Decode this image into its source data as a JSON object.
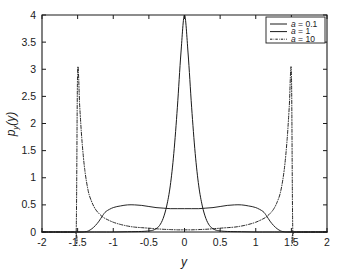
{
  "figure": {
    "name": "probability-density-plot",
    "background_color": "#ffffff",
    "line_color": "#1a1a1a"
  },
  "axes": {
    "xlabel": "y",
    "ylabel_main": "p",
    "ylabel_sub": "y",
    "ylabel_arg": "(y)",
    "ylabel_full": "p_y (y)",
    "x_ticks": [
      "-2",
      "-1.5",
      "-1",
      "-0.5",
      "0",
      "0.5",
      "1",
      "1.5",
      "2"
    ],
    "y_ticks": [
      "0",
      "0.5",
      "1",
      "1.5",
      "2",
      "2.5",
      "3",
      "3.5",
      "4"
    ],
    "xlim": [
      -2,
      2
    ],
    "ylim": [
      0,
      4
    ]
  },
  "legend": {
    "position": "top-right",
    "entries": [
      {
        "label_prefix": "a",
        "label_suffix": " = 0.1",
        "style": "solid"
      },
      {
        "label_prefix": "a",
        "label_suffix": " = 1",
        "style": "solid-thin"
      },
      {
        "label_prefix": "a",
        "label_suffix": " = 10",
        "style": "dashdot"
      }
    ]
  },
  "chart_data": {
    "type": "line",
    "title": "",
    "xlabel": "y",
    "ylabel": "p_y (y)",
    "xlim": [
      -2,
      2
    ],
    "ylim": [
      0,
      4
    ],
    "grid": false,
    "legend_position": "upper right",
    "x_ticks": [
      -2,
      -1.5,
      -1,
      -0.5,
      0,
      0.5,
      1,
      1.5,
      2
    ],
    "y_ticks": [
      0,
      0.5,
      1,
      1.5,
      2,
      2.5,
      3,
      3.5,
      4
    ],
    "series": [
      {
        "name": "a = 0.1",
        "style": "solid",
        "description": "Sharp unimodal peak centered at y = 0 reaching 4.0, decaying to near zero by |y| = 0.45",
        "x": [
          -2,
          -1.5,
          -1.2,
          -1.0,
          -0.8,
          -0.6,
          -0.5,
          -0.45,
          -0.4,
          -0.35,
          -0.3,
          -0.25,
          -0.2,
          -0.15,
          -0.1,
          -0.05,
          0,
          0.05,
          0.1,
          0.15,
          0.2,
          0.25,
          0.3,
          0.35,
          0.4,
          0.45,
          0.5,
          0.6,
          0.8,
          1.0,
          1.2,
          1.5,
          2
        ],
        "y": [
          0.0,
          0.0,
          0.0,
          0.0,
          0.005,
          0.01,
          0.02,
          0.03,
          0.06,
          0.12,
          0.25,
          0.48,
          0.85,
          1.45,
          2.3,
          3.3,
          4.0,
          3.3,
          2.3,
          1.45,
          0.85,
          0.48,
          0.25,
          0.12,
          0.06,
          0.03,
          0.02,
          0.01,
          0.005,
          0.0,
          0.0,
          0.0,
          0.0
        ]
      },
      {
        "name": "a = 1",
        "style": "solid-thin",
        "description": "Broad flat plateau spanning roughly -1.1 to 1.1 at about 0.45-0.50, slight dip to 0.43 at center, falling to zero near |y| = 1.35",
        "x": [
          -2,
          -1.5,
          -1.4,
          -1.35,
          -1.3,
          -1.25,
          -1.2,
          -1.15,
          -1.1,
          -1.0,
          -0.9,
          -0.8,
          -0.7,
          -0.6,
          -0.5,
          -0.4,
          -0.3,
          -0.2,
          -0.1,
          0,
          0.1,
          0.2,
          0.3,
          0.4,
          0.5,
          0.6,
          0.7,
          0.8,
          0.9,
          1.0,
          1.1,
          1.15,
          1.2,
          1.25,
          1.3,
          1.35,
          1.4,
          1.5,
          2
        ],
        "y": [
          0.0,
          0.0,
          0.005,
          0.02,
          0.06,
          0.12,
          0.2,
          0.3,
          0.38,
          0.45,
          0.48,
          0.5,
          0.5,
          0.49,
          0.47,
          0.45,
          0.44,
          0.43,
          0.43,
          0.43,
          0.43,
          0.43,
          0.44,
          0.45,
          0.47,
          0.49,
          0.5,
          0.5,
          0.48,
          0.45,
          0.38,
          0.3,
          0.2,
          0.12,
          0.06,
          0.02,
          0.005,
          0.0,
          0.0
        ]
      },
      {
        "name": "a = 10",
        "style": "dashdot",
        "description": "Bimodal U-shaped density with near-vertical walls at y = -1.52 and y = 1.52 peaking at 2.95, low valley around 0.03-0.07 in the middle",
        "x": [
          -2,
          -1.55,
          -1.52,
          -1.5,
          -1.47,
          -1.44,
          -1.4,
          -1.35,
          -1.3,
          -1.25,
          -1.2,
          -1.15,
          -1.1,
          -1.0,
          -0.9,
          -0.8,
          -0.7,
          -0.6,
          -0.5,
          -0.4,
          -0.3,
          -0.2,
          -0.1,
          0,
          0.1,
          0.2,
          0.3,
          0.4,
          0.5,
          0.6,
          0.7,
          0.8,
          0.9,
          1.0,
          1.1,
          1.15,
          1.2,
          1.25,
          1.3,
          1.35,
          1.4,
          1.44,
          1.47,
          1.5,
          1.52,
          1.55,
          2
        ],
        "y": [
          0.0,
          0.0,
          0.0,
          2.95,
          2.3,
          1.7,
          1.15,
          0.75,
          0.55,
          0.42,
          0.34,
          0.28,
          0.24,
          0.18,
          0.14,
          0.11,
          0.09,
          0.08,
          0.07,
          0.06,
          0.05,
          0.045,
          0.04,
          0.04,
          0.04,
          0.045,
          0.05,
          0.06,
          0.07,
          0.08,
          0.09,
          0.11,
          0.14,
          0.18,
          0.24,
          0.28,
          0.34,
          0.42,
          0.55,
          0.75,
          1.15,
          1.7,
          2.3,
          2.95,
          0.0,
          0.0,
          0.0
        ]
      }
    ]
  }
}
